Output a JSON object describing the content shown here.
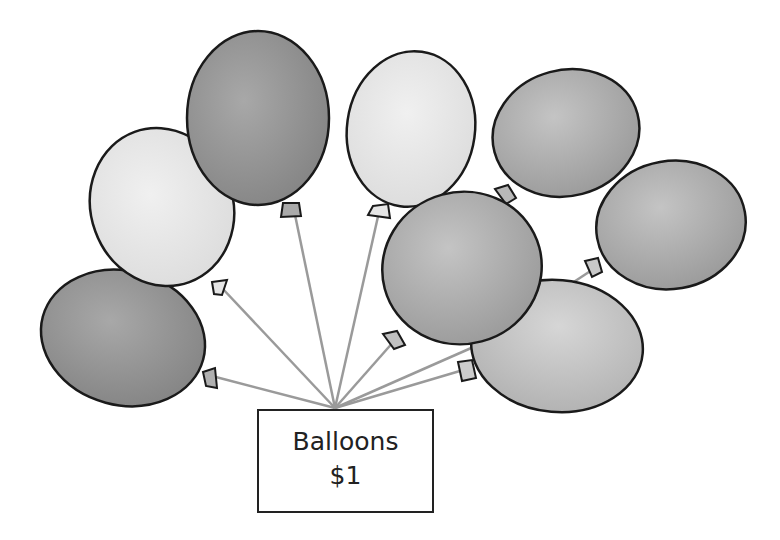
{
  "sign": {
    "title": "Balloons",
    "price": "$1"
  },
  "balloons": {
    "count": 8,
    "items": [
      {
        "name": "far-left",
        "shade": "dark"
      },
      {
        "name": "upper-left",
        "shade": "light"
      },
      {
        "name": "top-left",
        "shade": "dark"
      },
      {
        "name": "top-center",
        "shade": "light"
      },
      {
        "name": "top-right",
        "shade": "medium"
      },
      {
        "name": "center",
        "shade": "medium"
      },
      {
        "name": "far-right",
        "shade": "medium"
      },
      {
        "name": "lower-right",
        "shade": "light-medium"
      }
    ]
  },
  "colors": {
    "outline": "#1a1a1a",
    "string": "#9a9a9a",
    "dark": "#8f8f8f",
    "medium": "#a9a9a9",
    "light_medium": "#bdbdbd",
    "light": "#e2e2e2",
    "background": "#ffffff"
  }
}
